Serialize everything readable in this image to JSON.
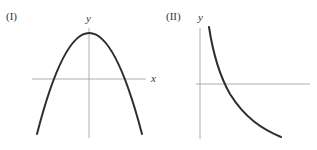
{
  "graphs": [
    {
      "label": "(I)",
      "x_axis_label": "x",
      "y_axis_label": "y",
      "curve": "downward-opening parabola, vertex on positive y-axis, two x-intercepts symmetric about y-axis"
    },
    {
      "label": "(II)",
      "x_axis_label": "",
      "y_axis_label": "y",
      "curve": "decreasing concave-up curve, starts high near y-axis, crosses x-axis, continues below x-axis"
    }
  ]
}
